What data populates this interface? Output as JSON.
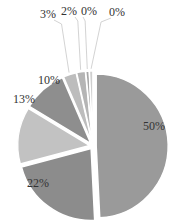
{
  "chart_data": {
    "type": "pie",
    "title": "",
    "categories": [
      "A",
      "B",
      "C",
      "D",
      "E",
      "F",
      "G",
      "H"
    ],
    "values": [
      50,
      22,
      13,
      10,
      3,
      2,
      0,
      0
    ],
    "labels": [
      "50%",
      "22%",
      "13%",
      "10%",
      "3%",
      "2%",
      "0%",
      "0%"
    ],
    "colors": [
      "#9a9a9a",
      "#8c8c8c",
      "#c2c2c2",
      "#8e8e8e",
      "#bdbdbd",
      "#b5b5b5",
      "#a8a8a8",
      "#cfcfcf"
    ],
    "start_angle": "12 o'clock",
    "direction": "clockwise",
    "exploded": true,
    "legend": "none"
  }
}
